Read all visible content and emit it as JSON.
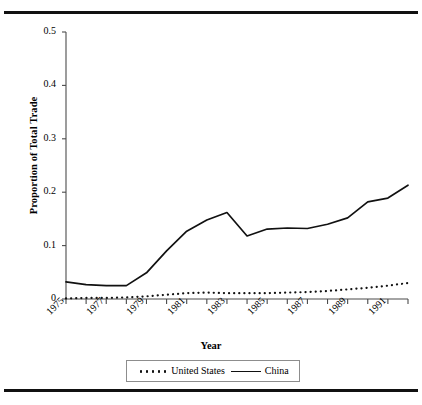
{
  "figure": {
    "top_rule": "horizontal-rule",
    "bottom_rule": "horizontal-rule"
  },
  "chart_data": {
    "type": "line",
    "title": "",
    "xlabel": "Year",
    "ylabel": "Proportion of Total Trade",
    "xlim": [
      1975,
      1992
    ],
    "ylim": [
      0,
      0.5
    ],
    "grid": false,
    "legend_position": "bottom",
    "y_ticks": [
      "0.5",
      "0.4",
      "0.3",
      "0.2",
      "0.1",
      "0"
    ],
    "y_tick_values": [
      0.5,
      0.4,
      0.3,
      0.2,
      0.1,
      0
    ],
    "x_ticks": [
      "1975",
      "1977",
      "1979",
      "1981",
      "1983",
      "1985",
      "1987",
      "1989",
      "1991"
    ],
    "x_tick_values": [
      1975,
      1977,
      1979,
      1981,
      1983,
      1985,
      1987,
      1989,
      1991
    ],
    "x_minor_every": 1,
    "x": [
      1975,
      1976,
      1977,
      1978,
      1979,
      1980,
      1981,
      1982,
      1983,
      1984,
      1985,
      1986,
      1987,
      1988,
      1989,
      1990,
      1991,
      1992
    ],
    "series": [
      {
        "name": "United States",
        "style": "dotted",
        "color": "#111111",
        "values": [
          0.001,
          0.002,
          0.002,
          0.003,
          0.005,
          0.008,
          0.011,
          0.012,
          0.011,
          0.011,
          0.011,
          0.012,
          0.013,
          0.015,
          0.018,
          0.021,
          0.025,
          0.03
        ]
      },
      {
        "name": "China",
        "style": "solid",
        "color": "#111111",
        "values": [
          0.032,
          0.027,
          0.025,
          0.025,
          0.049,
          0.09,
          0.127,
          0.148,
          0.162,
          0.118,
          0.131,
          0.133,
          0.132,
          0.14,
          0.152,
          0.182,
          0.189,
          0.213
        ]
      }
    ]
  },
  "legend": {
    "entries": [
      {
        "label": "United States",
        "style": "dotted"
      },
      {
        "label": "China",
        "style": "solid"
      }
    ]
  }
}
